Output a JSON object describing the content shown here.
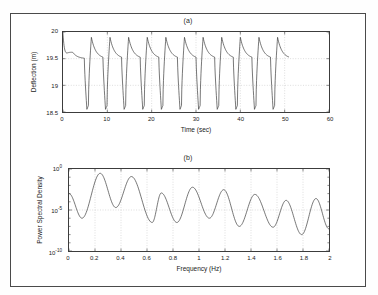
{
  "figure": {
    "background": "#ffffff",
    "frame_color": "#4a4a4a",
    "line_color": "#3a3a3a",
    "grid_color": "#b9b9b9"
  },
  "subplot_a": {
    "title": "(a)",
    "xlabel": "Time (sec)",
    "ylabel": "Deflection (m)",
    "xticks": [
      "0",
      "10",
      "20",
      "30",
      "40",
      "50",
      "60"
    ],
    "yticks": [
      "18.5",
      "19",
      "19.5",
      "20"
    ]
  },
  "subplot_b": {
    "title": "(b)",
    "xlabel": "Frequency (Hz)",
    "ylabel": "Power Spectral Density",
    "xticks": [
      "0",
      "0.2",
      "0.4",
      "0.6",
      "0.8",
      "1",
      "1.2",
      "1.4",
      "1.6",
      "1.8",
      "2"
    ],
    "yticks": [
      "10",
      "10",
      "10"
    ],
    "yexponents": [
      "0",
      "-5",
      "-10"
    ]
  },
  "chart_data": [
    {
      "type": "line",
      "id": "subplot-a",
      "title": "(a)",
      "xlabel": "Time (sec)",
      "ylabel": "Deflection (m)",
      "xlim": [
        0,
        60
      ],
      "ylim": [
        18.5,
        20
      ],
      "xticks": [
        0,
        10,
        20,
        30,
        40,
        50,
        60
      ],
      "yticks": [
        18.5,
        19,
        19.5,
        20
      ],
      "grid": true,
      "legend": "none",
      "description": "Relaxation-type self-excited oscillation of deflection; after a short transient starting near 19.95 m and settling to about 19.6 m, a limit cycle develops with sharp rise to ~19.9 m, slow decay to ~19.5 m, then a rapid drop to ~18.55 m and fast recovery. Data record ends at about t = 51 s.",
      "cycle_period_sec": 4.2,
      "fundamental_frequency_hz": 0.238,
      "num_cycles": 12,
      "cycle_peak_m": 19.9,
      "cycle_trough_m": 18.55,
      "plateau_m": 19.5,
      "transient": {
        "start_value_m": 19.95,
        "settle_value_m": 19.62,
        "duration_sec": 2.2
      },
      "series": [
        {
          "name": "Deflection",
          "color": "#3a3a3a",
          "x": [
            0,
            0.3,
            0.6,
            0.9,
            1.2,
            1.5,
            1.8,
            2.1,
            2.4,
            2.7,
            3.0,
            3.3,
            3.6,
            3.9,
            4.2
          ],
          "y_first_cycle": [
            19.95,
            19.78,
            19.68,
            19.63,
            19.61,
            19.6,
            19.58,
            19.52,
            19.2,
            18.7,
            18.55,
            18.62,
            19.3,
            19.85,
            19.9
          ]
        }
      ]
    },
    {
      "type": "line",
      "id": "subplot-b",
      "title": "(b)",
      "xlabel": "Frequency (Hz)",
      "ylabel": "Power Spectral Density",
      "xlim": [
        0,
        2
      ],
      "ylim": [
        1e-10,
        1
      ],
      "yscale": "log",
      "xticks": [
        0,
        0.2,
        0.4,
        0.6,
        0.8,
        1,
        1.2,
        1.4,
        1.6,
        1.8,
        2
      ],
      "yticks": [
        1,
        1e-05,
        1e-10
      ],
      "ytick_labels": [
        "10^0",
        "10^-5",
        "10^-10"
      ],
      "grid": true,
      "legend": "none",
      "description": "Log-scale power spectral density of the deflection signal showing a fundamental peak at about 0.24 Hz and a series of harmonics at integer multiples, with peak amplitudes decaying with frequency and deep troughs between harmonics.",
      "fundamental_hz": 0.238,
      "peaks": [
        {
          "freq_hz": 0.24,
          "psd": 0.3
        },
        {
          "freq_hz": 0.48,
          "psd": 0.12
        },
        {
          "freq_hz": 0.71,
          "psd": 0.0012
        },
        {
          "freq_hz": 0.95,
          "psd": 0.006
        },
        {
          "freq_hz": 1.19,
          "psd": 0.003
        },
        {
          "freq_hz": 1.43,
          "psd": 0.0008
        },
        {
          "freq_hz": 1.67,
          "psd": 0.00015
        },
        {
          "freq_hz": 1.9,
          "psd": 0.00025
        }
      ],
      "troughs": [
        {
          "freq_hz": 0.1,
          "psd": 1e-06
        },
        {
          "freq_hz": 0.36,
          "psd": 2e-05
        },
        {
          "freq_hz": 0.64,
          "psd": 3e-07
        },
        {
          "freq_hz": 0.83,
          "psd": 3e-07
        },
        {
          "freq_hz": 1.08,
          "psd": 1e-06
        },
        {
          "freq_hz": 1.31,
          "psd": 1e-07
        },
        {
          "freq_hz": 1.57,
          "psd": 8e-08
        },
        {
          "freq_hz": 1.79,
          "psd": 1e-08
        },
        {
          "freq_hz": 2.0,
          "psd": 5e-08
        }
      ],
      "start_value_psd": 0.001
    }
  ]
}
